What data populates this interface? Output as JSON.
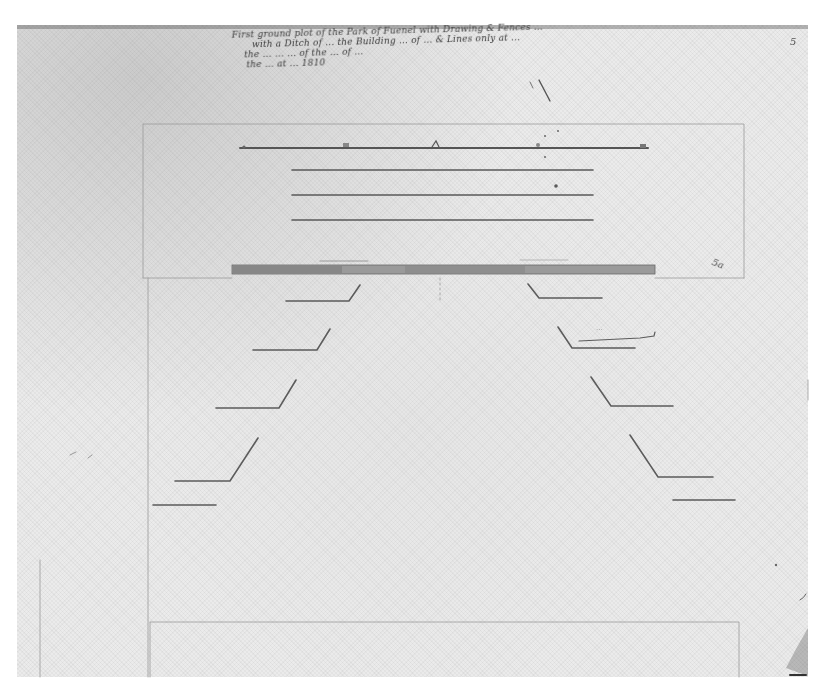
{
  "document": {
    "type": "scanned historical manuscript plan drawing",
    "paper_color": "#ebebeb",
    "ink_color": "#4a4a4a",
    "heading_lines": [
      "First ground plot of the Park of Fuenel with Drawing & Fences ...",
      "with a Ditch of ... the Building ... of ... & Lines only at ...",
      "the ... ... ... of the ... of ...",
      "the ... at ... 1810"
    ],
    "heading_legibility": "largely illegible handwriting",
    "margin_marks": {
      "top_right": "5",
      "right_side": "5a",
      "annotation_near_right_step": "..."
    },
    "drawing": {
      "frame_top": {
        "x1": 143,
        "y1": 124,
        "x2": 744,
        "y2": 278
      },
      "top_baseline": {
        "x1": 240,
        "x2": 648,
        "y": 148,
        "tick_marks_x": [
          244,
          346,
          437,
          538,
          644
        ]
      },
      "parallel_lines": [
        {
          "x1": 292,
          "x2": 593,
          "y": 170
        },
        {
          "x1": 292,
          "x2": 593,
          "y": 195
        },
        {
          "x1": 292,
          "x2": 593,
          "y": 220
        }
      ],
      "thick_band": {
        "x1": 232,
        "x2": 655,
        "y": 269,
        "height": 8
      },
      "left_steps": [
        {
          "diag_from": [
            360,
            285
          ],
          "corner": [
            349,
            301
          ],
          "end_x": 286
        },
        {
          "diag_from": [
            330,
            329
          ],
          "corner": [
            317,
            350
          ],
          "end_x": 253
        },
        {
          "diag_from": [
            296,
            380
          ],
          "corner": [
            279,
            408
          ],
          "end_x": 216
        },
        {
          "diag_from": [
            258,
            438
          ],
          "corner": [
            230,
            481
          ],
          "end_x": 175
        },
        {
          "diag_from": null,
          "corner": [
            216,
            505
          ],
          "end_x": 153
        }
      ],
      "right_steps": [
        {
          "diag_from": [
            528,
            284
          ],
          "corner": [
            539,
            298
          ],
          "end_x": 602
        },
        {
          "diag_from": [
            558,
            327
          ],
          "corner": [
            572,
            348
          ],
          "end_x": 635
        },
        {
          "diag_from": [
            591,
            377
          ],
          "corner": [
            611,
            406
          ],
          "end_x": 673
        },
        {
          "diag_from": [
            630,
            435
          ],
          "corner": [
            658,
            477
          ],
          "end_x": 713
        },
        {
          "diag_from": null,
          "corner": [
            673,
            500
          ],
          "end_x": 735
        }
      ],
      "bottom_frame": {
        "x1": 150,
        "y1": 622,
        "x2": 739,
        "y2": 677
      }
    }
  }
}
